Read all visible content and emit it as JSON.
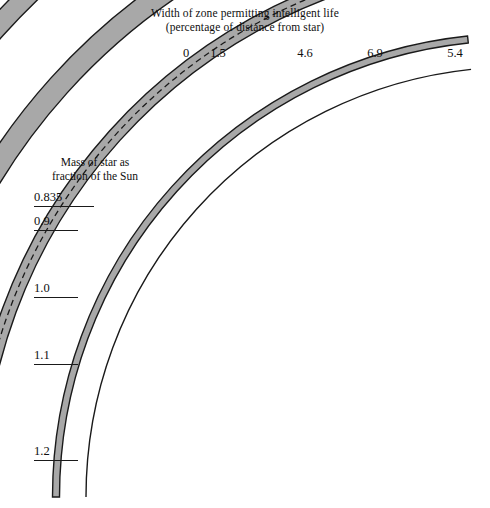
{
  "figure": {
    "title_line1": "Width of zone permitting intelligent life",
    "title_line2": "(percentage of distance from star)",
    "axis_caption_line1": "Mass of star as",
    "axis_caption_line2": "fraction of the Sun",
    "background_color": "#ffffff",
    "band_fill_color": "#a8a8a8",
    "band_stroke_color": "#1a1a1a",
    "dashed_line_color": "#1a1a1a"
  },
  "chart_data": {
    "type": "area",
    "title": "Width of zone permitting intelligent life (percentage of distance from star)",
    "xlabel": "",
    "ylabel": "Mass of star as fraction of the Sun",
    "grid": false,
    "legend": "none",
    "categories": [
      "0.835",
      "0.9",
      "1.0",
      "1.1",
      "1.2"
    ],
    "series": [
      {
        "name": "Width of zone permitting intelligent life (%)",
        "values": [
          0,
          1.5,
          4.6,
          6.9,
          5.4
        ]
      }
    ],
    "annotations": [
      "The 1.0 solar-mass band contains a dashed centre line marking the Earth-like orbit.",
      "The 0.835 solar-mass case has zero zone width and is drawn as a single thin arc."
    ],
    "arcs": [
      {
        "mass_label": "0.835",
        "width_label": "0",
        "width_percent": 0,
        "radius": 430,
        "band_thickness": 0,
        "hairline": true,
        "dashed_center": false,
        "top_label_x": 186,
        "top_label_y": 46,
        "mass_label_x": 34,
        "mass_label_y": 190,
        "mass_label_width": 60
      },
      {
        "mass_label": "0.9",
        "width_label": "1.5",
        "width_percent": 1.5,
        "radius": 460,
        "band_thickness": 7,
        "hairline": false,
        "dashed_center": false,
        "top_label_x": 218,
        "top_label_y": 46,
        "mass_label_x": 34,
        "mass_label_y": 214,
        "mass_label_width": 44
      },
      {
        "mass_label": "1.0",
        "width_label": "4.6",
        "width_percent": 4.6,
        "radius": 540,
        "band_thickness": 14,
        "hairline": false,
        "dashed_center": true,
        "top_label_x": 305,
        "top_label_y": 46,
        "mass_label_x": 34,
        "mass_label_y": 281,
        "mass_label_width": 44
      },
      {
        "mass_label": "1.1",
        "width_label": "6.9",
        "width_percent": 6.9,
        "radius": 615,
        "band_thickness": 22,
        "hairline": false,
        "dashed_center": false,
        "top_label_x": 375,
        "top_label_y": 46,
        "mass_label_x": 34,
        "mass_label_y": 348,
        "mass_label_width": 44
      },
      {
        "mass_label": "1.2",
        "width_label": "5.4",
        "width_percent": 5.4,
        "radius": 700,
        "band_thickness": 20,
        "hairline": false,
        "dashed_center": false,
        "top_label_x": 455,
        "top_label_y": 46,
        "mass_label_x": 34,
        "mass_label_y": 444,
        "mass_label_width": 44
      }
    ]
  }
}
